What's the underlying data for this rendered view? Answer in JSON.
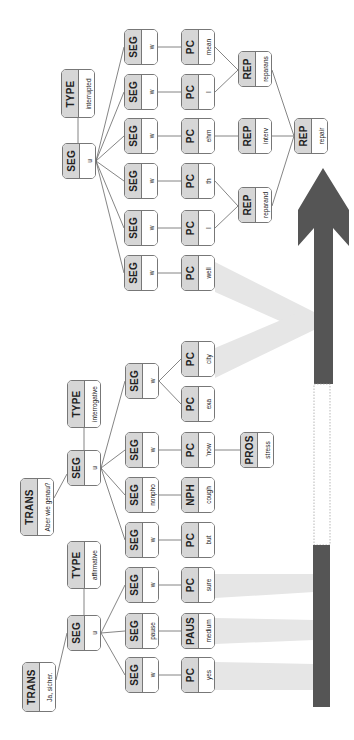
{
  "diagram": {
    "orientation": "rotated-90-ccw",
    "colors": {
      "node_tag_bg": "#d6d6d6",
      "node_border": "#777777",
      "arrow": "#555555",
      "wedge": "#e4e4e4"
    },
    "nodes": {
      "type_interrupted": {
        "tag": "TYPE",
        "value": "interrupted"
      },
      "seg_u_repair": {
        "tag": "SEG",
        "value": "u"
      },
      "seg_w_1": {
        "tag": "SEG",
        "value": "w"
      },
      "seg_w_2": {
        "tag": "SEG",
        "value": "w"
      },
      "seg_w_3": {
        "tag": "SEG",
        "value": "w"
      },
      "seg_w_4": {
        "tag": "SEG",
        "value": "w"
      },
      "seg_w_5": {
        "tag": "SEG",
        "value": "w"
      },
      "seg_w_6": {
        "tag": "SEG",
        "value": "w"
      },
      "pc_mean": {
        "tag": "PC",
        "value": "mean"
      },
      "pc_I_2": {
        "tag": "PC",
        "value": "I"
      },
      "pc_ehm": {
        "tag": "PC",
        "value": "ehm"
      },
      "pc_th": {
        "tag": "PC",
        "value": "th"
      },
      "pc_I_1": {
        "tag": "PC",
        "value": "I"
      },
      "pc_well": {
        "tag": "PC",
        "value": "well"
      },
      "rep_reparans": {
        "tag": "REP",
        "value": "reparans"
      },
      "rep_interv": {
        "tag": "REP",
        "value": "interv"
      },
      "rep_reparand": {
        "tag": "REP",
        "value": "reparand"
      },
      "rep_repair": {
        "tag": "REP",
        "value": "repair"
      },
      "trans_aber": {
        "tag": "TRANS",
        "value": "Aber wie genau?"
      },
      "seg_u_interrog": {
        "tag": "SEG",
        "value": "u"
      },
      "type_interrogative": {
        "tag": "TYPE",
        "value": "interrogative"
      },
      "seg_w_exacity": {
        "tag": "SEG",
        "value": "w"
      },
      "pc_city": {
        "tag": "PC",
        "value": "city"
      },
      "pc_exa": {
        "tag": "PC",
        "value": "exa"
      },
      "seg_w_now": {
        "tag": "SEG",
        "value": "w"
      },
      "pc_now": {
        "tag": "PC",
        "value": "'now"
      },
      "pros_stress": {
        "tag": "PROS",
        "value": "stress"
      },
      "seg_nonpho": {
        "tag": "SEG",
        "value": "nonpho"
      },
      "nph_cough": {
        "tag": "NPH",
        "value": "cough"
      },
      "seg_w_but": {
        "tag": "SEG",
        "value": "w"
      },
      "pc_but": {
        "tag": "PC",
        "value": "but"
      },
      "trans_ja": {
        "tag": "TRANS",
        "value": "Ja, sicher."
      },
      "seg_u_affirm": {
        "tag": "SEG",
        "value": "u"
      },
      "type_affirmative": {
        "tag": "TYPE",
        "value": "affirmative"
      },
      "seg_w_sure": {
        "tag": "SEG",
        "value": "w"
      },
      "pc_sure": {
        "tag": "PC",
        "value": "sure"
      },
      "seg_pause": {
        "tag": "SEG",
        "value": "pause"
      },
      "paus_medium": {
        "tag": "PAUS",
        "value": "medium"
      },
      "seg_w_yes": {
        "tag": "SEG",
        "value": "w"
      },
      "pc_yes": {
        "tag": "PC",
        "value": "yes"
      }
    }
  }
}
